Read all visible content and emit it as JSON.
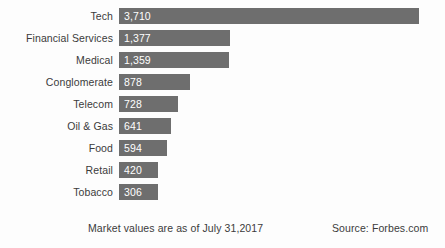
{
  "chart_data": {
    "type": "bar",
    "orientation": "horizontal",
    "title": "",
    "xlabel": "",
    "ylabel": "",
    "grid": false,
    "legend": false,
    "xlim": [
      0,
      3710
    ],
    "categories": [
      "Tech",
      "Financial Services",
      "Medical",
      "Conglomerate",
      "Telecom",
      "Oil & Gas",
      "Food",
      "Retail",
      "Tobacco"
    ],
    "values": [
      3710,
      1377,
      1359,
      878,
      728,
      641,
      594,
      420,
      306
    ],
    "value_labels": [
      "3,710",
      "1,377",
      "1,359",
      "878",
      "728",
      "641",
      "594",
      "420",
      "306"
    ],
    "bar_color": "#6e6e6e",
    "value_label_color": "#ffffff",
    "category_label_color": "#3b3b3b",
    "background_color": "#fdfdfd"
  },
  "footer": {
    "asof_note": "Market values are as of July 31,2017",
    "source_note": "Source: Forbes.com"
  }
}
